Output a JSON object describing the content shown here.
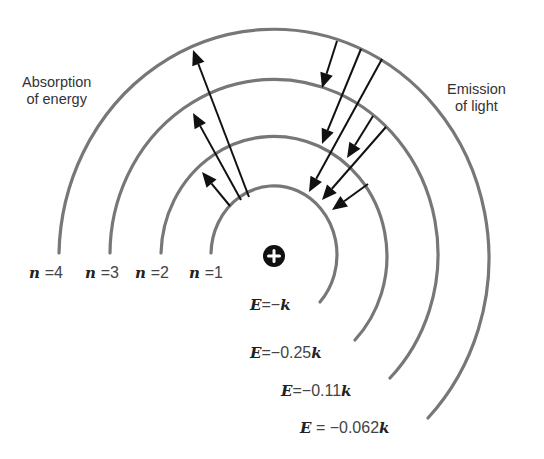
{
  "labels": {
    "absorption": [
      "Absorption",
      "of energy"
    ],
    "emission": [
      "Emission",
      "of light"
    ]
  },
  "nucleus": {
    "symbol": "+",
    "cx": 274,
    "cy": 256,
    "r": 11,
    "color": "#111111"
  },
  "colors": {
    "orbit": "#777777",
    "arrow": "#111111",
    "text": "#333333"
  },
  "levels": [
    {
      "n": "1",
      "n_label": "n",
      "eq": "=",
      "energy_var": "E",
      "energy_eq": "=",
      "energy_value": "−",
      "energy_unit": "k",
      "rx": 63,
      "ry": 69,
      "end": [
        320,
        302
      ]
    },
    {
      "n": "2",
      "n_label": "n",
      "eq": "=",
      "energy_var": "E",
      "energy_eq": "=",
      "energy_value": "−0.25",
      "energy_unit": "k",
      "rx": 113,
      "ry": 120,
      "end": [
        355,
        340
      ]
    },
    {
      "n": "3",
      "n_label": "n",
      "eq": "=",
      "energy_var": "E",
      "energy_eq": "=",
      "energy_value": "−0.11",
      "energy_unit": "k",
      "rx": 164,
      "ry": 175,
      "end": [
        390,
        378
      ]
    },
    {
      "n": "4",
      "n_label": "n",
      "eq": "=",
      "energy_var": "E",
      "energy_eq": " = ",
      "energy_value": "−0.062",
      "energy_unit": "k",
      "rx": 215,
      "ry": 229,
      "end": [
        428,
        418
      ]
    }
  ],
  "absorption_arrows": [
    {
      "from": "1",
      "to": "2",
      "start": [
        230,
        206
      ],
      "tip": [
        202,
        172
      ]
    },
    {
      "from": "1",
      "to": "3",
      "start": [
        241,
        200
      ],
      "tip": [
        193,
        113
      ]
    },
    {
      "from": "1",
      "to": "4",
      "start": [
        249,
        197
      ],
      "tip": [
        193,
        50
      ]
    }
  ],
  "emission_arrows": [
    {
      "from": "4",
      "to": "3",
      "start": [
        337,
        41
      ],
      "tip": [
        322,
        88
      ]
    },
    {
      "from": "4",
      "to": "2",
      "start": [
        361,
        49
      ],
      "tip": [
        322,
        144
      ]
    },
    {
      "from": "4",
      "to": "1",
      "start": [
        382,
        59
      ],
      "tip": [
        309,
        192
      ]
    },
    {
      "from": "3",
      "to": "2",
      "start": [
        373,
        116
      ],
      "tip": [
        347,
        158
      ]
    },
    {
      "from": "3",
      "to": "1",
      "start": [
        386,
        127
      ],
      "tip": [
        322,
        200
      ]
    },
    {
      "from": "2",
      "to": "1",
      "start": [
        368,
        184
      ],
      "tip": [
        332,
        210
      ]
    }
  ]
}
